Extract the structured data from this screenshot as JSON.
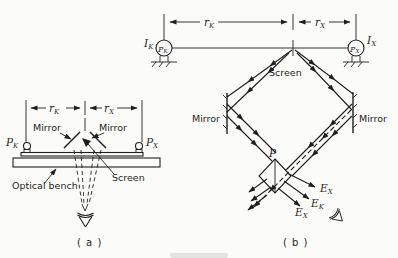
{
  "figure": {
    "ink_color": "#1f1f1f",
    "background_color": "#fbfbf9",
    "symbols": {
      "r": "r",
      "I": "I",
      "P": "P",
      "E": "E",
      "sub_k": "K",
      "sub_x": "X"
    },
    "panel_a": {
      "caption": "( a )",
      "labels": {
        "mirror_left": "Mirror",
        "mirror_right": "Mirror",
        "screen": "Screen",
        "optical_bench": "Optical bench"
      }
    },
    "panel_b": {
      "caption": "( b )",
      "labels": {
        "mirror_left": "Mirror",
        "mirror_right": "Mirror",
        "screen": "Screen",
        "photometer_point": "P"
      }
    }
  }
}
